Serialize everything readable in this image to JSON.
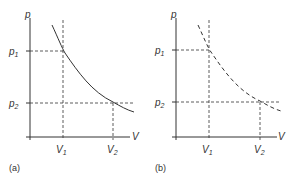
{
  "panels": [
    {
      "caption": "(a)",
      "y_axis_label": "p",
      "x_axis_label": "V",
      "y_ticks": [
        {
          "base": "p",
          "sub": "1"
        },
        {
          "base": "p",
          "sub": "2"
        }
      ],
      "x_ticks": [
        {
          "base": "V",
          "sub": "1"
        },
        {
          "base": "V",
          "sub": "2"
        }
      ],
      "curve_style": "solid"
    },
    {
      "caption": "(b)",
      "y_axis_label": "p",
      "x_axis_label": "V",
      "y_ticks": [
        {
          "base": "p",
          "sub": "1"
        },
        {
          "base": "p",
          "sub": "2"
        }
      ],
      "x_ticks": [
        {
          "base": "V",
          "sub": "1"
        },
        {
          "base": "V",
          "sub": "2"
        }
      ],
      "curve_style": "dashed"
    }
  ],
  "colors": {
    "line": "#333333",
    "background": "#ffffff"
  }
}
